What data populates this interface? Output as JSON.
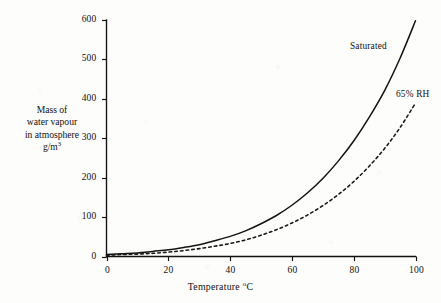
{
  "chart_data": {
    "type": "line",
    "title": "",
    "xlabel": "Temperature °C",
    "ylabel": "Mass of water vapour in atmosphere g/m³",
    "xlim": [
      0,
      100
    ],
    "ylim": [
      0,
      600
    ],
    "grid": false,
    "legend_position": "inline-annotation",
    "x_ticks": [
      0,
      20,
      40,
      60,
      80,
      100
    ],
    "y_ticks": [
      0,
      100,
      200,
      300,
      400,
      500,
      600
    ],
    "x_tick_labels": [
      "0",
      "20",
      "40",
      "60",
      "80",
      "100"
    ],
    "y_tick_labels": [
      "0",
      "100",
      "200",
      "300",
      "400",
      "500",
      "600"
    ],
    "x": [
      0,
      5,
      10,
      15,
      20,
      25,
      30,
      35,
      40,
      45,
      50,
      55,
      60,
      65,
      70,
      75,
      80,
      85,
      90,
      95,
      100
    ],
    "series": [
      {
        "name": "Saturated",
        "style": "solid",
        "color": "#131313",
        "label_x": 78,
        "label_y": 505,
        "values": [
          5,
          7,
          9,
          13,
          17,
          23,
          30,
          40,
          51,
          65,
          83,
          104,
          130,
          161,
          198,
          242,
          293,
          353,
          421,
          503,
          598
        ]
      },
      {
        "name": "65% RH",
        "style": "dashed",
        "color": "#181818",
        "label_x": 92,
        "label_y": 390,
        "values": [
          3,
          5,
          6,
          8,
          11,
          15,
          20,
          26,
          33,
          42,
          54,
          68,
          85,
          105,
          129,
          157,
          190,
          229,
          274,
          327,
          389
        ]
      }
    ],
    "annotations": [
      {
        "text": "Saturated",
        "at_x": 78,
        "at_y": 505
      },
      {
        "text": "65% RH",
        "at_x": 92,
        "at_y": 390
      }
    ]
  },
  "axes": {
    "y_title_lines": [
      "Mass of",
      "water vapour",
      "in atmosphere"
    ],
    "y_title_unit": "g/m",
    "y_title_unit_exponent": "3",
    "x_title_text": "Temperature ",
    "x_title_degree": "o",
    "x_title_unit": "C"
  },
  "labels": {
    "saturated": "Saturated",
    "rh65": "65% RH"
  }
}
